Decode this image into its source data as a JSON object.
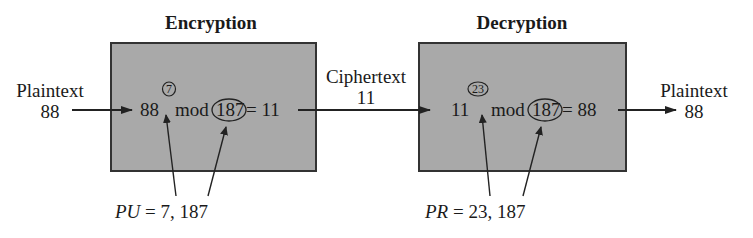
{
  "encryption": {
    "title": "Encryption",
    "base": "88",
    "exponent": "7",
    "op": "mod",
    "modulus": "187",
    "equals": "= 11",
    "key_name": "PU",
    "key_value": "= 7, 187"
  },
  "decryption": {
    "title": "Decryption",
    "base": "11",
    "exponent": "23",
    "op": "mod",
    "modulus": "187",
    "equals": "= 88",
    "key_name": "PR",
    "key_value": "= 23, 187"
  },
  "input": {
    "label": "Plaintext",
    "value": "88"
  },
  "ciphertext": {
    "label": "Ciphertext",
    "value": "11"
  },
  "output": {
    "label": "Plaintext",
    "value": "88"
  },
  "colors": {
    "box_fill": "#a9a9a9",
    "stroke": "#222222"
  }
}
